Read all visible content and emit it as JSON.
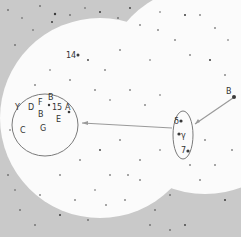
{
  "map": {
    "colors": {
      "outside": "#c9c9c9",
      "field": "#fbfbfb",
      "star": "#3a3a3a",
      "ring": "#7a7a7a",
      "pointer": "#9a9a9a",
      "label": "#333333"
    },
    "labels": {
      "l14": "14",
      "lY": "Y",
      "lD": "D",
      "lF": "F",
      "lB1": "B",
      "l15": "15",
      "lA": "A",
      "lB2": "B",
      "lE": "E",
      "lC": "C",
      "lG": "G",
      "ldelta": "δ",
      "lgamma": "γ",
      "l7": "7",
      "lBright": "B"
    }
  }
}
